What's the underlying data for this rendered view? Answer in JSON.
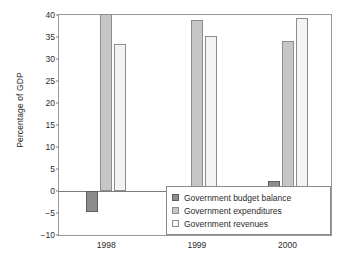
{
  "chart_data": {
    "type": "bar",
    "title": "",
    "xlabel": "",
    "ylabel": "Percentage of GDP",
    "categories": [
      "1998",
      "1999",
      "2000"
    ],
    "ylim": [
      -10,
      40
    ],
    "yticks": [
      40,
      35,
      30,
      25,
      20,
      15,
      10,
      5,
      0,
      -5,
      -10
    ],
    "ytick_labels": [
      "40",
      "35",
      "30",
      "25",
      "20",
      "15",
      "10",
      "5",
      "0",
      "−5",
      "−10"
    ],
    "grid": false,
    "legend_position": "bottom-right",
    "series": [
      {
        "name": "Government budget balance",
        "color": "#8c8c8c",
        "values": [
          -4.8,
          -2.4,
          2.3
        ]
      },
      {
        "name": "Government expenditures",
        "color": "#c6c6c6",
        "values": [
          40.3,
          38.9,
          34.2
        ]
      },
      {
        "name": "Government revenues",
        "color": "#f3f3f3",
        "values": [
          33.3,
          35.3,
          39.3
        ]
      }
    ]
  }
}
